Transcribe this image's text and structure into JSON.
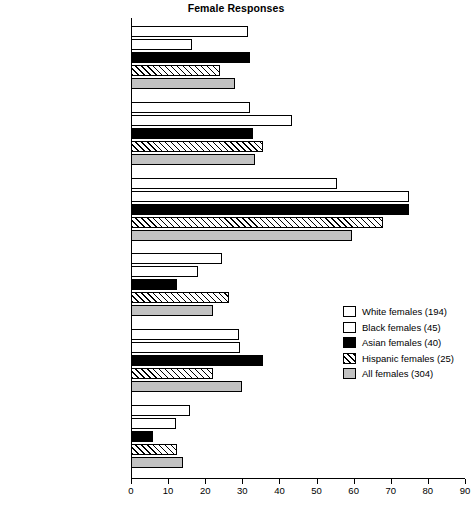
{
  "chart_data": {
    "type": "bar",
    "orientation": "horizontal",
    "title": "Female Responses",
    "xlabel": "",
    "ylabel": "",
    "xlim": [
      0,
      90
    ],
    "xticks": [
      0,
      10,
      20,
      30,
      40,
      50,
      60,
      70,
      80,
      90
    ],
    "xtick_labels": [
      "0",
      "10",
      "20",
      "30",
      "40",
      "50",
      "60",
      "70",
      "80",
      "90"
    ],
    "grid": false,
    "legend_position": "center-right",
    "categories": [
      "Use emotion",
      "Use reason/facts",
      "Listen, connect",
      "Try to win",
      "Peacekeeper",
      "Contentious, enjoy conflict"
    ],
    "series": [
      {
        "name": "White females (194)",
        "fill": "white",
        "values": [
          31.5,
          32,
          55.5,
          24.5,
          29,
          16
        ]
      },
      {
        "name": "Black females (45)",
        "fill": "dotted",
        "values": [
          16.5,
          43.5,
          75,
          18,
          29.5,
          12
        ]
      },
      {
        "name": "Asian females (40)",
        "fill": "black",
        "values": [
          32,
          33,
          75,
          12.5,
          35.5,
          6
        ]
      },
      {
        "name": "Hispanic females (25)",
        "fill": "hatched",
        "values": [
          24,
          35.5,
          68,
          26.5,
          22,
          12.5
        ]
      },
      {
        "name": "All females (304)",
        "fill": "gray",
        "values": [
          28,
          33.5,
          59.5,
          22,
          30,
          14
        ]
      }
    ]
  },
  "legend": {
    "items": [
      {
        "label": "White females (194)",
        "swatch": "white"
      },
      {
        "label": "Black females (45)",
        "swatch": "dotted"
      },
      {
        "label": "Asian females (40)",
        "swatch": "black"
      },
      {
        "label": "Hispanic females (25)",
        "swatch": "hatched"
      },
      {
        "label": "All females (304)",
        "swatch": "gray"
      }
    ]
  },
  "colors": {
    "axis": "#000000",
    "white_fill": "#ffffff",
    "black_fill": "#000000",
    "gray_fill": "#c2c2c2",
    "background": "#ffffff"
  }
}
